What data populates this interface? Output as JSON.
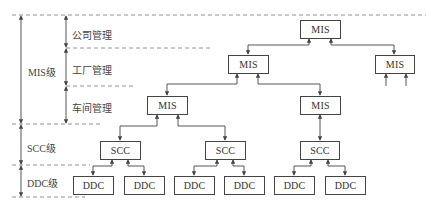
{
  "diagram": {
    "type": "hierarchical-control-system",
    "levels": [
      {
        "id": "mis",
        "label": "MIS级",
        "sublevels": [
          {
            "id": "company",
            "label": "公司管理"
          },
          {
            "id": "factory",
            "label": "工厂管理"
          },
          {
            "id": "workshop",
            "label": "车间管理"
          }
        ]
      },
      {
        "id": "scc",
        "label": "SCC级"
      },
      {
        "id": "ddc",
        "label": "DDC级"
      }
    ],
    "nodes": {
      "mis_top": "MIS",
      "mis_factory_left": "MIS",
      "mis_factory_right": "MIS",
      "mis_workshop_1": "MIS",
      "mis_workshop_2": "MIS",
      "scc_1": "SCC",
      "scc_2": "SCC",
      "scc_3": "SCC",
      "ddc_1": "DDC",
      "ddc_2": "DDC",
      "ddc_3": "DDC",
      "ddc_4": "DDC",
      "ddc_5": "DDC",
      "ddc_6": "DDC"
    },
    "edges": [
      [
        "mis_top",
        "mis_factory_left"
      ],
      [
        "mis_top",
        "mis_factory_right"
      ],
      [
        "mis_factory_left",
        "mis_workshop_1"
      ],
      [
        "mis_factory_left",
        "mis_workshop_2"
      ],
      [
        "mis_workshop_1",
        "scc_1"
      ],
      [
        "mis_workshop_1",
        "scc_2"
      ],
      [
        "mis_workshop_2",
        "scc_3"
      ],
      [
        "scc_1",
        "ddc_1"
      ],
      [
        "scc_1",
        "ddc_2"
      ],
      [
        "scc_2",
        "ddc_3"
      ],
      [
        "scc_2",
        "ddc_4"
      ],
      [
        "scc_3",
        "ddc_5"
      ],
      [
        "scc_3",
        "ddc_6"
      ]
    ]
  }
}
